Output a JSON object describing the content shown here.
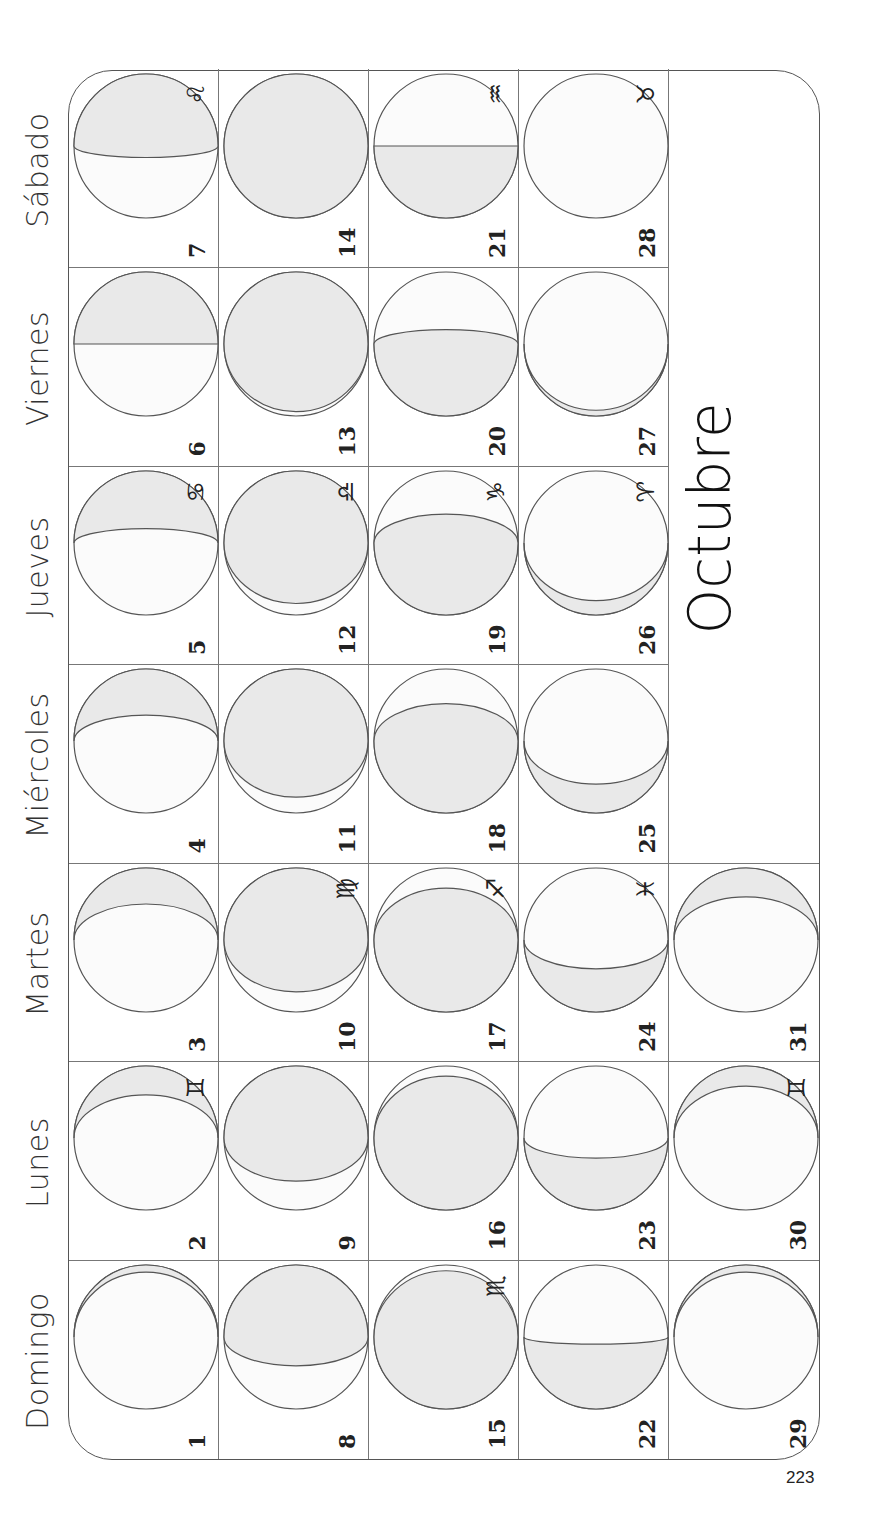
{
  "page_number": "223",
  "month_title": "Octubre",
  "weekdays": [
    "Domingo",
    "Lunes",
    "Martes",
    "Miércoles",
    "Jueves",
    "Viernes",
    "Sábado"
  ],
  "colors": {
    "shade": "#e9e9e9",
    "lit": "#fbfbfb",
    "line": "#555555"
  },
  "days": [
    {
      "day": "1",
      "col": 0,
      "row": 0,
      "shade": 0.05,
      "side": "right",
      "sign": ""
    },
    {
      "day": "2",
      "col": 1,
      "row": 0,
      "shade": 0.2,
      "side": "right",
      "sign": "♊"
    },
    {
      "day": "3",
      "col": 2,
      "row": 0,
      "shade": 0.25,
      "side": "right",
      "sign": ""
    },
    {
      "day": "4",
      "col": 3,
      "row": 0,
      "shade": 0.32,
      "side": "right",
      "sign": ""
    },
    {
      "day": "5",
      "col": 4,
      "row": 0,
      "shade": 0.4,
      "side": "right",
      "sign": "♋"
    },
    {
      "day": "6",
      "col": 5,
      "row": 0,
      "shade": 0.5,
      "side": "right",
      "sign": ""
    },
    {
      "day": "7",
      "col": 6,
      "row": 0,
      "shade": 0.58,
      "side": "right",
      "sign": "♌"
    },
    {
      "day": "8",
      "col": 0,
      "row": 1,
      "shade": 0.7,
      "side": "right",
      "sign": ""
    },
    {
      "day": "9",
      "col": 1,
      "row": 1,
      "shade": 0.8,
      "side": "right",
      "sign": ""
    },
    {
      "day": "10",
      "col": 2,
      "row": 1,
      "shade": 0.86,
      "side": "right",
      "sign": "♍"
    },
    {
      "day": "11",
      "col": 3,
      "row": 1,
      "shade": 0.89,
      "side": "right",
      "sign": ""
    },
    {
      "day": "12",
      "col": 4,
      "row": 1,
      "shade": 0.92,
      "side": "right",
      "sign": "♎"
    },
    {
      "day": "13",
      "col": 5,
      "row": 1,
      "shade": 0.97,
      "side": "right",
      "sign": ""
    },
    {
      "day": "14",
      "col": 6,
      "row": 1,
      "shade": 1.0,
      "side": "right",
      "sign": ""
    },
    {
      "day": "15",
      "col": 0,
      "row": 2,
      "shade": 0.96,
      "side": "left",
      "sign": "♏"
    },
    {
      "day": "16",
      "col": 1,
      "row": 2,
      "shade": 0.93,
      "side": "left",
      "sign": ""
    },
    {
      "day": "17",
      "col": 2,
      "row": 2,
      "shade": 0.86,
      "side": "left",
      "sign": "♐"
    },
    {
      "day": "18",
      "col": 3,
      "row": 2,
      "shade": 0.76,
      "side": "left",
      "sign": ""
    },
    {
      "day": "19",
      "col": 4,
      "row": 2,
      "shade": 0.7,
      "side": "left",
      "sign": "♑"
    },
    {
      "day": "20",
      "col": 5,
      "row": 2,
      "shade": 0.6,
      "side": "left",
      "sign": ""
    },
    {
      "day": "21",
      "col": 6,
      "row": 2,
      "shade": 0.5,
      "side": "left",
      "sign": "♒"
    },
    {
      "day": "22",
      "col": 0,
      "row": 3,
      "shade": 0.45,
      "side": "left",
      "sign": ""
    },
    {
      "day": "23",
      "col": 1,
      "row": 3,
      "shade": 0.36,
      "side": "left",
      "sign": ""
    },
    {
      "day": "24",
      "col": 2,
      "row": 3,
      "shade": 0.3,
      "side": "left",
      "sign": "♓"
    },
    {
      "day": "25",
      "col": 3,
      "row": 3,
      "shade": 0.2,
      "side": "left",
      "sign": ""
    },
    {
      "day": "26",
      "col": 4,
      "row": 3,
      "shade": 0.1,
      "side": "left",
      "sign": "♈"
    },
    {
      "day": "27",
      "col": 5,
      "row": 3,
      "shade": 0.04,
      "side": "left",
      "sign": ""
    },
    {
      "day": "28",
      "col": 6,
      "row": 3,
      "shade": 0.0,
      "side": "left",
      "sign": "♉"
    },
    {
      "day": "29",
      "col": 0,
      "row": 4,
      "shade": 0.05,
      "side": "right",
      "sign": ""
    },
    {
      "day": "30",
      "col": 1,
      "row": 4,
      "shade": 0.14,
      "side": "right",
      "sign": "♊"
    },
    {
      "day": "31",
      "col": 2,
      "row": 4,
      "shade": 0.2,
      "side": "right",
      "sign": ""
    }
  ]
}
